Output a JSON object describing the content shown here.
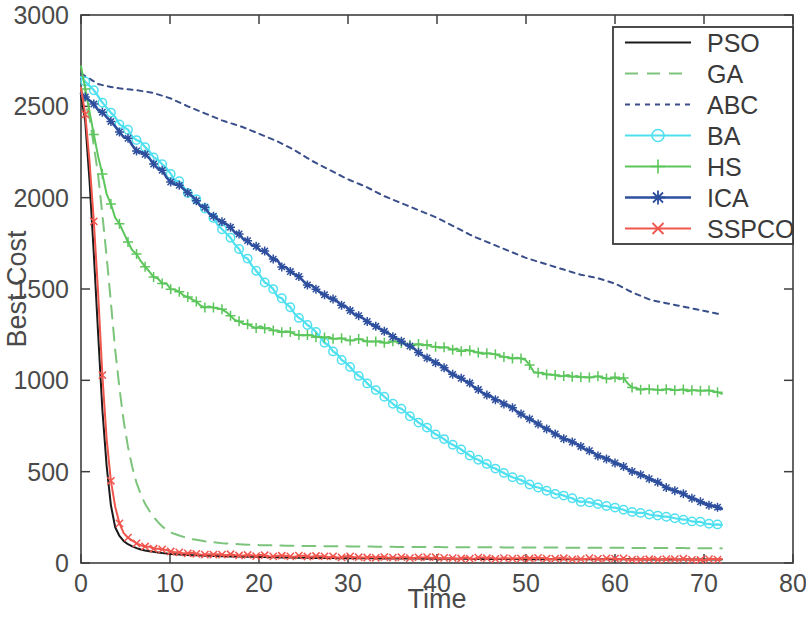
{
  "chart_data": {
    "type": "line",
    "title": "",
    "xlabel": "Time",
    "ylabel": "Best Cost",
    "xlim": [
      0,
      80
    ],
    "ylim": [
      0,
      3000
    ],
    "xticks": [
      0,
      10,
      20,
      30,
      40,
      50,
      60,
      70,
      80
    ],
    "yticks": [
      0,
      500,
      1000,
      1500,
      2000,
      2500,
      3000
    ],
    "xtick_labels": [
      "0",
      "10",
      "20",
      "30",
      "40",
      "50",
      "60",
      "70",
      "80"
    ],
    "ytick_labels": [
      "0",
      "500",
      "1000",
      "1500",
      "2000",
      "2500",
      "3000"
    ],
    "grid": false,
    "legend_position": "upper right",
    "x_data_end": 72,
    "series": [
      {
        "name": "PSO",
        "color": "#1a1a1a",
        "style": "solid",
        "marker": "none",
        "linewidth": 2.0,
        "x": [
          0,
          0.6,
          1.2,
          1.8,
          2.2,
          2.6,
          3.0,
          3.4,
          3.8,
          4.4,
          5.0,
          6.0,
          7.0,
          8.0,
          9.0,
          10.0,
          12.0,
          14.0,
          16.0,
          18.0,
          20.0,
          23.0,
          26.0,
          30.0,
          34.0,
          38.0,
          42.0,
          46.0,
          50.0,
          54.0,
          58.0,
          62.0,
          66.0,
          70.0,
          72.0
        ],
        "y": [
          2560,
          2380,
          1900,
          1380,
          980,
          700,
          460,
          300,
          200,
          140,
          110,
          85,
          70,
          62,
          55,
          50,
          44,
          40,
          37,
          35,
          33,
          30,
          28,
          26,
          25,
          24,
          23,
          22,
          21,
          21,
          20,
          20,
          19,
          19,
          19
        ]
      },
      {
        "name": "GA",
        "color": "#7cc47c",
        "style": "dashed",
        "marker": "none",
        "linewidth": 2.0,
        "x": [
          0,
          1.0,
          2.0,
          3.0,
          4.0,
          5.0,
          6.0,
          7.0,
          8.0,
          9.0,
          10.0,
          12.0,
          14.0,
          16.0,
          18.0,
          20.0,
          24.0,
          28.0,
          32.0,
          36.0,
          40.0,
          45.0,
          50.0,
          55.0,
          60.0,
          65.0,
          70.0,
          72.0
        ],
        "y": [
          2600,
          2430,
          2100,
          1620,
          1080,
          700,
          470,
          340,
          260,
          205,
          168,
          135,
          118,
          108,
          102,
          98,
          94,
          92,
          90,
          88,
          87,
          86,
          85,
          84,
          83,
          82,
          81,
          80
        ]
      },
      {
        "name": "ABC",
        "color": "#3a4f8a",
        "style": "dotted",
        "marker": "none",
        "linewidth": 2.0,
        "x": [
          0,
          2,
          4,
          6,
          8,
          10,
          12,
          14,
          16,
          18,
          20,
          22,
          24,
          26,
          28,
          30,
          32,
          34,
          36,
          38,
          40,
          42,
          44,
          46,
          48,
          50,
          52,
          54,
          56,
          58,
          60,
          62,
          64,
          66,
          68,
          70,
          72
        ],
        "y": [
          2680,
          2620,
          2600,
          2590,
          2575,
          2545,
          2500,
          2460,
          2420,
          2390,
          2350,
          2310,
          2260,
          2200,
          2150,
          2100,
          2060,
          2010,
          1970,
          1930,
          1890,
          1840,
          1790,
          1750,
          1710,
          1670,
          1640,
          1610,
          1580,
          1560,
          1530,
          1480,
          1440,
          1420,
          1400,
          1380,
          1360
        ]
      },
      {
        "name": "BA",
        "color": "#4fe0f0",
        "style": "solid",
        "marker": "circle",
        "linewidth": 2.2,
        "x": [
          0,
          2,
          4,
          6,
          8,
          10,
          12,
          14,
          16,
          18,
          20,
          22,
          24,
          26,
          28,
          30,
          32,
          34,
          36,
          38,
          40,
          42,
          44,
          46,
          48,
          50,
          52,
          54,
          56,
          58,
          60,
          62,
          64,
          66,
          68,
          70,
          72
        ],
        "y": [
          2660,
          2560,
          2430,
          2330,
          2230,
          2130,
          2030,
          1930,
          1820,
          1700,
          1580,
          1470,
          1370,
          1280,
          1180,
          1080,
          990,
          910,
          840,
          770,
          700,
          640,
          580,
          530,
          480,
          440,
          400,
          370,
          340,
          320,
          300,
          280,
          265,
          250,
          235,
          220,
          205
        ]
      },
      {
        "name": "HS",
        "color": "#5cc65c",
        "style": "solid",
        "marker": "plus",
        "linewidth": 2.0,
        "x": [
          0,
          2,
          3,
          4,
          5,
          6,
          7,
          8,
          9,
          10,
          12,
          14,
          16,
          17,
          18,
          20,
          22,
          24,
          26,
          28,
          30,
          33,
          36,
          39,
          42,
          45,
          48,
          50,
          51,
          53,
          55,
          57,
          59,
          61,
          62,
          64,
          66,
          68,
          70,
          72
        ],
        "y": [
          2720,
          2200,
          2000,
          1880,
          1790,
          1700,
          1630,
          1580,
          1540,
          1510,
          1450,
          1400,
          1385,
          1340,
          1310,
          1290,
          1275,
          1255,
          1240,
          1230,
          1225,
          1215,
          1205,
          1190,
          1170,
          1150,
          1130,
          1110,
          1040,
          1030,
          1025,
          1020,
          1015,
          1010,
          955,
          950,
          948,
          945,
          942,
          930
        ]
      },
      {
        "name": "ICA",
        "color": "#2e4f9e",
        "style": "solid",
        "marker": "asterisk",
        "linewidth": 2.6,
        "x": [
          0,
          2,
          4,
          6,
          8,
          10,
          12,
          14,
          16,
          18,
          20,
          22,
          24,
          26,
          28,
          30,
          32,
          34,
          36,
          38,
          40,
          42,
          44,
          46,
          48,
          50,
          52,
          54,
          56,
          58,
          60,
          62,
          64,
          66,
          68,
          70,
          72
        ],
        "y": [
          2570,
          2490,
          2380,
          2280,
          2190,
          2100,
          2020,
          1940,
          1860,
          1790,
          1720,
          1650,
          1580,
          1510,
          1450,
          1390,
          1330,
          1270,
          1210,
          1150,
          1090,
          1030,
          970,
          910,
          860,
          800,
          740,
          690,
          640,
          590,
          550,
          500,
          460,
          410,
          370,
          330,
          295
        ]
      },
      {
        "name": "SSPCO",
        "color": "#f0564e",
        "style": "solid",
        "marker": "x",
        "linewidth": 2.0,
        "x": [
          0,
          0.6,
          1.2,
          1.8,
          2.2,
          2.6,
          3.0,
          3.4,
          4.0,
          4.6,
          5.2,
          6.0,
          7.0,
          8.0,
          9.0,
          10.0,
          12.0,
          14.0,
          16.0,
          18.0,
          20.0,
          23.0,
          26.0,
          30.0,
          34.0,
          38.0,
          42.0,
          46.0,
          50.0,
          54.0,
          58.0,
          62.0,
          66.0,
          70.0,
          72.0
        ],
        "y": [
          2600,
          2420,
          2050,
          1600,
          1200,
          860,
          600,
          430,
          260,
          175,
          140,
          112,
          95,
          82,
          72,
          64,
          54,
          48,
          45,
          43,
          41,
          38,
          36,
          33,
          31,
          29,
          27,
          26,
          25,
          24,
          23,
          22,
          21,
          20,
          20
        ]
      }
    ]
  },
  "legend": {
    "entries": [
      {
        "label": "PSO"
      },
      {
        "label": "GA"
      },
      {
        "label": "ABC"
      },
      {
        "label": "BA"
      },
      {
        "label": "HS"
      },
      {
        "label": "ICA"
      },
      {
        "label": "SSPCO"
      }
    ]
  },
  "colors": {
    "pso": "#1a1a1a",
    "ga": "#7cc47c",
    "abc": "#3a4f8a",
    "ba": "#4fe0f0",
    "hs": "#5cc65c",
    "ica": "#2e4f9e",
    "sspco": "#f0564e",
    "axis": "#3f3f3f",
    "text": "#4a4a4a"
  }
}
